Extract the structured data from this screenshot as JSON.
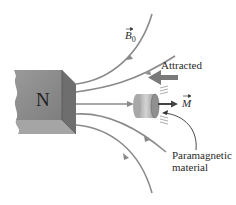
{
  "diagram": {
    "magnet": {
      "pole_label": "N"
    },
    "field": {
      "label": "B",
      "subscript": "0",
      "vector": true
    },
    "force": {
      "label": "Attracted"
    },
    "magnetization": {
      "label": "M",
      "vector": true
    },
    "material": {
      "label_line1": "Paramagnetic",
      "label_line2": "material"
    },
    "colors": {
      "field_line": "#8a8a8a",
      "magnet_front": "#8c8c8c",
      "magnet_top": "#bdbdbd",
      "magnet_side": "#707070",
      "force_arrow": "#7a7a7a",
      "cylinder": "#b8b8b8",
      "text": "#2a2a2a"
    }
  }
}
